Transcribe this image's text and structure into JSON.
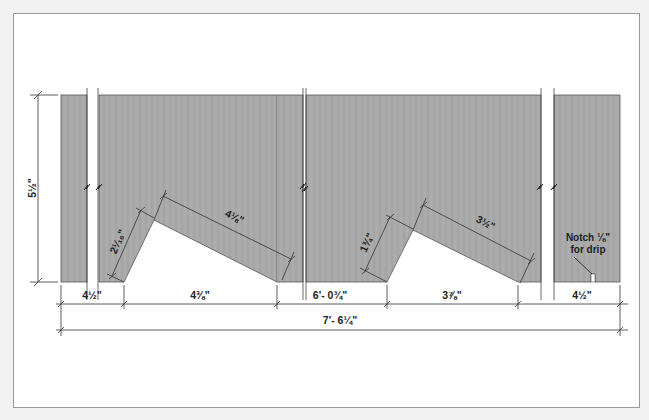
{
  "colors": {
    "page_bg": "#f1f1f1",
    "frame_bg": "#ffffff",
    "frame_border": "#9a9a9a",
    "board_fill": "#a8a8a8",
    "board_stroke": "#555555",
    "dim_line": "#333333",
    "text": "#222222"
  },
  "dimensions": {
    "height": "5½\"",
    "left_end": "4½\"",
    "cut1_run": "4⅜\"",
    "middle": "6'- 0¾\"",
    "cut2_run": "3⅞\"",
    "right_end": "4½\"",
    "overall": "7'- 6¼\"",
    "cut1_short_side": "2¹⁄₁₆\"",
    "cut1_long_side": "4⅛\"",
    "cut2_short_side": "1¾\"",
    "cut2_long_side": "3½\""
  },
  "note": {
    "line1": "Notch ⅛\"",
    "line2": "for drip"
  },
  "icons": {
    "break_symbol": "zigzag-break-icon",
    "dimension_tick": "tick-mark-icon"
  }
}
